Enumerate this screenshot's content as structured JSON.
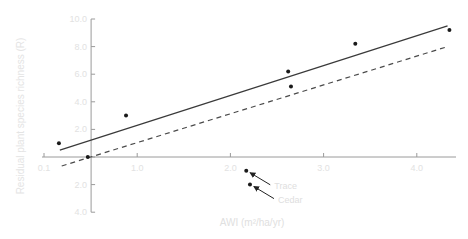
{
  "chart_data": {
    "type": "scatter",
    "title": "",
    "xlabel": "AWI (m²/ha/yr)",
    "ylabel": "Residual plant species richness (R)",
    "xlim": [
      0,
      4.5
    ],
    "ylim": [
      -4.0,
      10.0
    ],
    "x_ticks": [
      {
        "value": 0.0,
        "label": "0.1"
      },
      {
        "value": 1.0,
        "label": "1.0"
      },
      {
        "value": 2.0,
        "label": "2.0"
      },
      {
        "value": 3.0,
        "label": "3.0"
      },
      {
        "value": 4.0,
        "label": "4.0"
      }
    ],
    "y_ticks": [
      {
        "value": 10.0,
        "label": "10.0"
      },
      {
        "value": 8.0,
        "label": "8.0"
      },
      {
        "value": 6.0,
        "label": "6.0"
      },
      {
        "value": 4.0,
        "label": "4.0"
      },
      {
        "value": 2.0,
        "label": "2.0"
      },
      {
        "value": 0.0,
        "label": ""
      },
      {
        "value": -2.0,
        "label": "2.0"
      },
      {
        "value": -4.0,
        "label": "4.0"
      }
    ],
    "y_axis_at_x": 0.5,
    "grid": false,
    "series": [
      {
        "name": "sites",
        "type": "scatter",
        "points": [
          {
            "x": 0.16,
            "y": 1.0
          },
          {
            "x": 0.47,
            "y": 0.0
          },
          {
            "x": 0.88,
            "y": 3.0
          },
          {
            "x": 2.17,
            "y": -1.0
          },
          {
            "x": 2.21,
            "y": -2.0
          },
          {
            "x": 2.62,
            "y": 6.2
          },
          {
            "x": 2.65,
            "y": 5.1
          },
          {
            "x": 3.34,
            "y": 8.2
          },
          {
            "x": 4.35,
            "y": 9.2
          }
        ]
      },
      {
        "name": "regression (all sites)",
        "type": "line",
        "style": "solid",
        "points": [
          {
            "x": 0.17,
            "y": 0.5
          },
          {
            "x": 4.33,
            "y": 9.5
          }
        ]
      },
      {
        "name": "regression (dashed)",
        "type": "line",
        "style": "dashed",
        "points": [
          {
            "x": 0.19,
            "y": -0.65
          },
          {
            "x": 4.33,
            "y": 8.0
          }
        ]
      }
    ],
    "annotations": [
      {
        "text": "Trace",
        "point": {
          "x": 2.17,
          "y": -1.0
        },
        "arrow": true
      },
      {
        "text": "Cedar",
        "point": {
          "x": 2.21,
          "y": -2.0
        },
        "arrow": true
      }
    ],
    "colors": {
      "points": "#1a1a1a",
      "solid_line": "#3a3a3a",
      "dashed_line": "#4a4a4a",
      "axes": "#9a9a9a",
      "text": "#e0e0e0"
    }
  }
}
